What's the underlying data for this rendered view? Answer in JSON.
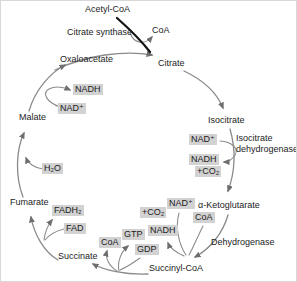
{
  "diagram": {
    "title_semantic": "citric-acid-cycle",
    "colors": {
      "background": "#ffffff",
      "highlight_box": "#d2d2d2",
      "arrow": "#8a8a8a",
      "entry_arrow": "#161616",
      "text": "#1c1c1c"
    },
    "nodes": {
      "acetyl_coa": "Acetyl-CoA",
      "coa_released": "CoA",
      "oxaloacetate": "Oxaloacetate",
      "citrate": "Citrate",
      "isocitrate": "Isocitrate",
      "alpha_ketoglutarate": "α-Ketoglutarate",
      "succinyl_coa": "Succinyl-CoA",
      "succinate": "Succinate",
      "fumarate": "Fumarate",
      "malate": "Malate"
    },
    "enzymes": {
      "citrate_synthase": "Citrate synthase",
      "isocitrate_dehydrogenase_line1": "Isocitrate",
      "isocitrate_dehydrogenase_line2": "dehydrogenase",
      "dehydrogenase": "Dehydrogenase"
    },
    "cofactors": {
      "nadh_malate": "NADH",
      "nad_malate": "NAD⁺",
      "h2o": "H₂O",
      "fadh2": "FADH₂",
      "fad": "FAD",
      "coa_succinate": "CoA",
      "gtp": "GTP",
      "gdp": "GDP",
      "nadh_succinyl": "NADH",
      "co2_succinyl": "+CO₂",
      "nad_succinyl": "NAD⁺",
      "coa_ketoglutarate": "CoA",
      "nad_isocitrate": "NAD⁺",
      "nadh_isocitrate": "NADH",
      "co2_isocitrate": "+CO₂"
    }
  }
}
